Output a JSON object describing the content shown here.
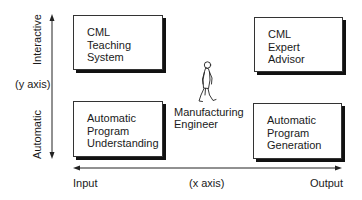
{
  "diagram": {
    "quadrants": {
      "top_left": {
        "lines": [
          "CML",
          "Teaching",
          "System"
        ]
      },
      "top_right": {
        "lines": [
          "CML",
          "Expert",
          "Advisor"
        ]
      },
      "bottom_left": {
        "lines": [
          "Automatic",
          "Program",
          "Understanding"
        ]
      },
      "bottom_right": {
        "lines": [
          "Automatic",
          "Program",
          "Generation"
        ]
      }
    },
    "center": {
      "figure": "walking-man-figure",
      "label_lines": [
        "Manufacturing",
        "Engineer"
      ]
    },
    "y_axis": {
      "top_label": "Interactive",
      "bottom_label": "Automatic",
      "name": "(y axis)"
    },
    "x_axis": {
      "left_label": "Input",
      "right_label": "Output",
      "name": "(x axis)"
    }
  }
}
